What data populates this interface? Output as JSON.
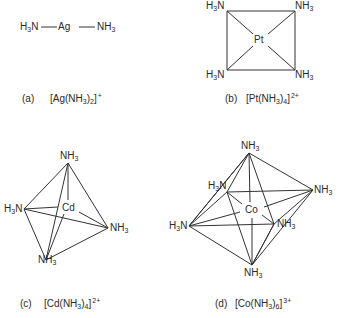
{
  "diagrams": [
    {
      "id": "a",
      "label": "(a)",
      "formula_parts": {
        "open": "[Ag(NH",
        "sub1": "3",
        "mid": ")",
        "sub2": "2",
        "close": "]",
        "charge": "+"
      },
      "geometry": "linear",
      "center": "Ag",
      "ligands": [
        "H3N",
        "NH3"
      ]
    },
    {
      "id": "b",
      "label": "(b)",
      "formula_parts": {
        "open": "[Pt(NH",
        "sub1": "3",
        "mid": ")",
        "sub2": "4",
        "close": "]",
        "charge": "2+"
      },
      "geometry": "square planar",
      "center": "Pt",
      "ligands": [
        "H3N",
        "NH3",
        "H3N",
        "NH3"
      ]
    },
    {
      "id": "c",
      "label": "(c)",
      "formula_parts": {
        "open": "[Cd(NH",
        "sub1": "3",
        "mid": ")",
        "sub2": "4",
        "close": "]",
        "charge": "2+"
      },
      "geometry": "tetrahedral",
      "center": "Cd",
      "ligands": [
        "NH3",
        "H3N",
        "NH3",
        "NH3"
      ]
    },
    {
      "id": "d",
      "label": "(d)",
      "formula_parts": {
        "open": "[Co(NH",
        "sub1": "3",
        "mid": ")",
        "sub2": "6",
        "close": "]",
        "charge": "3+"
      },
      "geometry": "octahedral",
      "center": "Co",
      "ligands": [
        "NH3",
        "H3N",
        "NH3",
        "H3N",
        "NH3",
        "NH3"
      ]
    }
  ],
  "atoms": {
    "nh3_main": "NH",
    "h3n_main": "H",
    "h3n_tail": "N",
    "three": "3"
  },
  "line_color": "#333333"
}
